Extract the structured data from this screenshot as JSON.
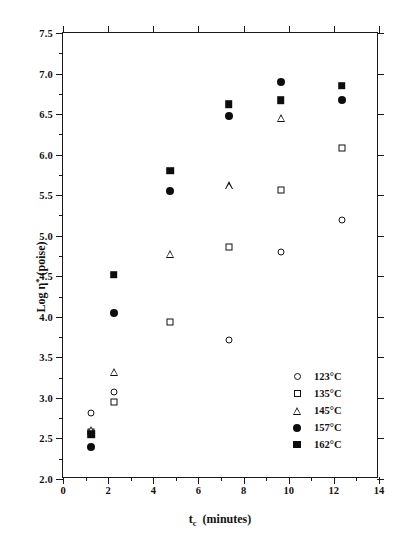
{
  "chart_data": {
    "type": "scatter",
    "title": "",
    "xlabel": "t_c  (minutes)",
    "ylabel": "Log η* (poise)",
    "xlim": [
      0,
      14
    ],
    "ylim": [
      2.0,
      7.5
    ],
    "xticks": [
      0,
      2,
      4,
      6,
      8,
      10,
      12,
      14
    ],
    "xtick_labels": [
      "0",
      "2",
      "4",
      "6",
      "8",
      "10",
      "12",
      "14"
    ],
    "xminor": [
      1,
      3,
      5,
      7,
      9,
      11,
      13
    ],
    "yticks": [
      2.0,
      2.5,
      3.0,
      3.5,
      4.0,
      4.5,
      5.0,
      5.5,
      6.0,
      6.5,
      7.0,
      7.5
    ],
    "ytick_labels": [
      "2.0",
      "2.5",
      "3.0",
      "3.5",
      "4.0",
      "4.5",
      "5.0",
      "5.5",
      "6.0",
      "6.5",
      "7.0",
      "7.5"
    ],
    "yminor": [
      2.25,
      2.75,
      3.25,
      3.75,
      4.25,
      4.75,
      5.25,
      5.75,
      6.25,
      6.75,
      7.25
    ],
    "grid": false,
    "legend_position": "lower-right-inside",
    "series": [
      {
        "name": "123°C",
        "marker": "circle-open",
        "points": [
          {
            "x": 1.25,
            "y": 2.82
          },
          {
            "x": 2.25,
            "y": 3.07
          },
          {
            "x": 7.35,
            "y": 3.72
          },
          {
            "x": 9.65,
            "y": 4.8
          },
          {
            "x": 12.35,
            "y": 5.2
          }
        ]
      },
      {
        "name": "135°C",
        "marker": "square-open",
        "points": [
          {
            "x": 1.25,
            "y": 2.58
          },
          {
            "x": 2.25,
            "y": 2.95
          },
          {
            "x": 4.75,
            "y": 3.94
          },
          {
            "x": 7.35,
            "y": 4.86
          },
          {
            "x": 9.65,
            "y": 5.57
          },
          {
            "x": 12.35,
            "y": 6.08
          }
        ]
      },
      {
        "name": "145°C",
        "marker": "triangle-open",
        "points": [
          {
            "x": 1.25,
            "y": 2.6
          },
          {
            "x": 2.25,
            "y": 3.32
          },
          {
            "x": 4.75,
            "y": 4.77
          },
          {
            "x": 7.35,
            "y": 5.62
          },
          {
            "x": 9.65,
            "y": 6.45
          }
        ]
      },
      {
        "name": "157°C",
        "marker": "circle-filled",
        "points": [
          {
            "x": 1.25,
            "y": 2.4
          },
          {
            "x": 2.25,
            "y": 4.05
          },
          {
            "x": 4.75,
            "y": 5.55
          },
          {
            "x": 7.35,
            "y": 6.48
          },
          {
            "x": 9.65,
            "y": 6.9
          },
          {
            "x": 12.35,
            "y": 6.67
          }
        ]
      },
      {
        "name": "162°C",
        "marker": "square-filled",
        "points": [
          {
            "x": 1.25,
            "y": 2.55
          },
          {
            "x": 2.25,
            "y": 4.52
          },
          {
            "x": 4.75,
            "y": 5.8
          },
          {
            "x": 7.35,
            "y": 6.62
          },
          {
            "x": 9.65,
            "y": 6.67
          },
          {
            "x": 12.35,
            "y": 6.85
          }
        ]
      }
    ],
    "legend": [
      {
        "label": "123°C",
        "marker": "circle-open"
      },
      {
        "label": "135°C",
        "marker": "square-open"
      },
      {
        "label": "145°C",
        "marker": "triangle-open"
      },
      {
        "label": "157°C",
        "marker": "circle-filled"
      },
      {
        "label": "162°C",
        "marker": "square-filled"
      }
    ],
    "axis_title_parts": {
      "y_prefix": "Log η",
      "y_sup": "*",
      "y_suffix": " (poise)",
      "x_main": "t",
      "x_sub": "c",
      "x_rest": "(minutes)"
    }
  }
}
